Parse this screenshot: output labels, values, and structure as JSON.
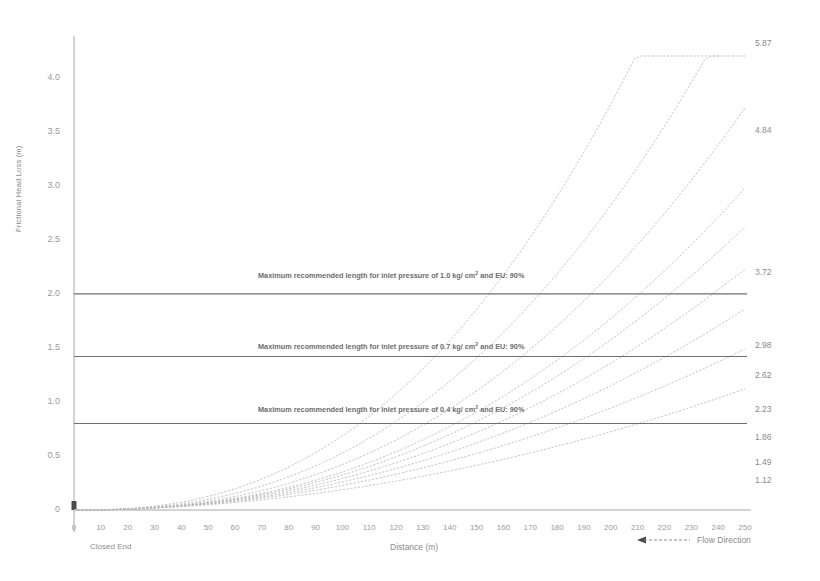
{
  "chart_data": {
    "type": "line",
    "title": "",
    "xlabel": "Distance (m)",
    "ylabel": "Frictional Head Loss (m)",
    "xlim": [
      0,
      250
    ],
    "ylim": [
      0,
      4.2
    ],
    "grid": false,
    "legend_position": "right-endpoint-labels",
    "x_ticks": [
      0,
      10,
      20,
      30,
      40,
      50,
      60,
      70,
      80,
      90,
      100,
      110,
      120,
      130,
      140,
      150,
      160,
      170,
      180,
      190,
      200,
      210,
      220,
      230,
      240,
      250
    ],
    "y_ticks": [
      "0",
      "0.5",
      "1.0",
      "1.5",
      "2.0",
      "2.5",
      "3.0",
      "3.5",
      "4.0"
    ],
    "y_tick_values": [
      0,
      0.5,
      1.0,
      1.5,
      2.0,
      2.5,
      3.0,
      3.5,
      4.0
    ],
    "origin_note": "Closed End",
    "flow_direction_label": "Flow Direction",
    "series": [
      {
        "name": "5.87",
        "end_label": "5.87",
        "end_value": 5.87,
        "x_end": 240,
        "exponent": 2.45
      },
      {
        "name": "4.84",
        "end_label": "4.84",
        "end_value": 4.84,
        "x_end": 250,
        "exponent": 2.42
      },
      {
        "name": "3.72",
        "end_label": "3.72",
        "end_value": 3.72,
        "x_end": 250,
        "exponent": 2.38
      },
      {
        "name": "2.98",
        "end_label": "2.98",
        "end_value": 2.98,
        "x_end": 250,
        "exponent": 2.33
      },
      {
        "name": "2.62",
        "end_label": "2.62",
        "end_value": 2.62,
        "x_end": 250,
        "exponent": 2.28
      },
      {
        "name": "2.23",
        "end_label": "2.23",
        "end_value": 2.23,
        "x_end": 250,
        "exponent": 2.22
      },
      {
        "name": "1.86",
        "end_label": "1.86",
        "end_value": 1.86,
        "x_end": 250,
        "exponent": 2.15
      },
      {
        "name": "1.49",
        "end_label": "1.49",
        "end_value": 1.49,
        "x_end": 250,
        "exponent": 2.05
      },
      {
        "name": "1.12",
        "end_label": "1.12",
        "end_value": 1.12,
        "x_end": 250,
        "exponent": 1.95
      }
    ],
    "reference_lines": [
      {
        "value": 2.0,
        "label": "Maximum recommended length for inlet pressure of 1.0 kg/ cm² and EU: 90%"
      },
      {
        "value": 1.42,
        "label": "Maximum recommended length for inlet pressure of 0.7 kg/ cm² and EU: 90%"
      },
      {
        "value": 0.8,
        "label": "Maximum recommended length for inlet pressure of 0.4 kg/ cm² and EU: 90%"
      }
    ],
    "colors": {
      "curve": "#b9b9b9",
      "reference_line": "#6e6e6e",
      "axis": "#9e9e9e",
      "text": "#8c8c8c",
      "background": "#ffffff"
    }
  }
}
